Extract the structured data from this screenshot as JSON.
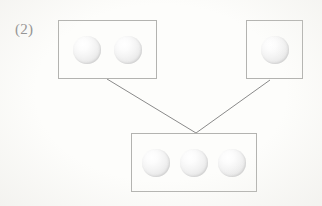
{
  "label": {
    "text": "(2)"
  },
  "colors": {
    "background": "#fdfdfb",
    "box_border": "#b3b3b0",
    "line": "#8a8a8a",
    "label_text": "#8d8d8d",
    "sphere_highlight": "#ffffff",
    "sphere_edge": "#d8d8d8"
  },
  "diagram": {
    "type": "addition-grouping",
    "boxes": [
      {
        "id": "top-left-group",
        "sphere_count": 2,
        "spheres": [
          "sphere",
          "sphere"
        ],
        "x": 58,
        "y": 20,
        "width": 99,
        "height": 59
      },
      {
        "id": "top-right-group",
        "sphere_count": 1,
        "spheres": [
          "sphere"
        ],
        "x": 246,
        "y": 20,
        "width": 57,
        "height": 59
      },
      {
        "id": "bottom-result-group",
        "sphere_count": 3,
        "spheres": [
          "sphere",
          "sphere",
          "sphere"
        ],
        "x": 131,
        "y": 133,
        "width": 126,
        "height": 59
      }
    ],
    "connectors": [
      {
        "id": "left-connector",
        "from_box": "top-left-group",
        "to_box": "bottom-result-group",
        "x1": 107,
        "y1": 79,
        "x2": 196,
        "y2": 133
      },
      {
        "id": "right-connector",
        "from_box": "top-right-group",
        "to_box": "bottom-result-group",
        "x1": 270,
        "y1": 80,
        "x2": 196,
        "y2": 133
      }
    ]
  }
}
